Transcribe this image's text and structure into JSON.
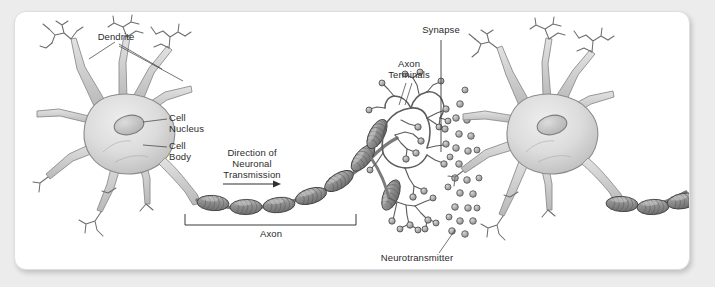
{
  "figure": {
    "background_color": "#ececec",
    "card_color": "#ffffff",
    "ink_color": "#2b2b2b",
    "soma_fill": "#d6d6d6",
    "soma_edge": "#8e8e8e",
    "myelin_fill": "#9a9a9a",
    "myelin_edge": "#4a4a4a",
    "vesicle_fill": "#b0b0b0",
    "terminal_color": "#5a5a5a"
  },
  "labels": {
    "dendrite": "Dendrite",
    "cell_nucleus_line1": "Cell",
    "cell_nucleus_line2": "Nucleus",
    "cell_body_line1": "Cell",
    "cell_body_line2": "Body",
    "direction_line1": "Direction of",
    "direction_line2": "Neuronal",
    "direction_line3": "Transmission",
    "axon": "Axon",
    "synapse": "Synapse",
    "axon_terminals_line1": "Axon",
    "axon_terminals_line2": "Terminals",
    "neurotransmitter": "Neurotransmitter"
  },
  "parts": [
    {
      "name": "dendrite",
      "label": "Dendrite"
    },
    {
      "name": "cell-nucleus",
      "label": "Cell Nucleus"
    },
    {
      "name": "cell-body",
      "label": "Cell Body"
    },
    {
      "name": "axon",
      "label": "Axon"
    },
    {
      "name": "direction-of-neuronal-transmission",
      "label": "Direction of Neuronal Transmission"
    },
    {
      "name": "axon-terminals",
      "label": "Axon Terminals"
    },
    {
      "name": "synapse",
      "label": "Synapse"
    },
    {
      "name": "neurotransmitter",
      "label": "Neurotransmitter"
    }
  ],
  "counts": {
    "left_myelin_segments": 8,
    "right_myelin_segments": 4,
    "neurotransmitter_vesicles": 26
  }
}
